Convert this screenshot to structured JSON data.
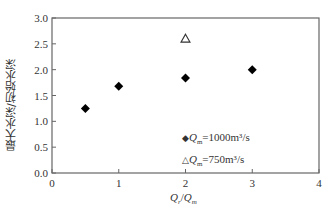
{
  "chart_data": {
    "type": "scatter",
    "title": "",
    "xlabel": "Qr/Qm",
    "ylabel": "最大水深/初始水深",
    "xlim": [
      0,
      4
    ],
    "ylim": [
      0.0,
      3.0
    ],
    "xticks": [
      "0",
      "1",
      "2",
      "3",
      "4"
    ],
    "yticks": [
      "0.0",
      "0.5",
      "1.0",
      "1.5",
      "2.0",
      "2.5",
      "3.0"
    ],
    "grid": false,
    "legend_position": "lower-center-inside",
    "series": [
      {
        "name": "Qm=1000m³/s",
        "marker": "filled-diamond",
        "color": "#000000",
        "x": [
          0.5,
          1,
          2,
          3
        ],
        "y": [
          1.25,
          1.68,
          1.84,
          2.0
        ]
      },
      {
        "name": "Qm=750m³/s",
        "marker": "open-triangle",
        "color": "#333333",
        "x": [
          2
        ],
        "y": [
          2.6
        ]
      }
    ]
  },
  "labels": {
    "ylabel": "最大水深/初始水深",
    "xlabel_main": "Q",
    "xlabel_sub1": "r",
    "xlabel_slash": "/",
    "xlabel_main2": "Q",
    "xlabel_sub2": "m"
  },
  "legend": {
    "items": [
      {
        "marker": "◆",
        "q": "Q",
        "sub": "m",
        "text": "=1000m³/s"
      },
      {
        "marker": "△",
        "q": "Q",
        "sub": "m",
        "text": "=750m³/s"
      }
    ]
  }
}
